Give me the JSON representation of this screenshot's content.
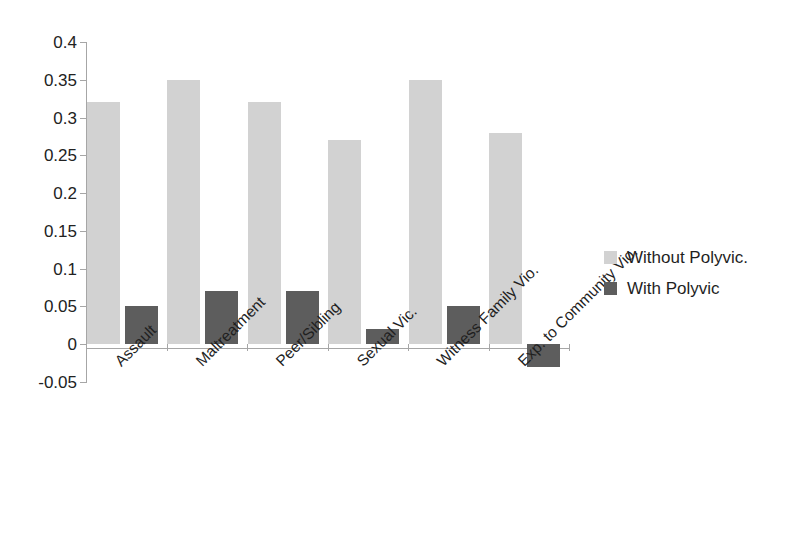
{
  "chart_data": {
    "type": "bar",
    "title": "",
    "subtitle": "",
    "xlabel": "",
    "ylabel": "",
    "categories": [
      "Assault",
      "Maltreatment",
      "Peer/Sibling",
      "Sexual Vic.",
      "Witness Family Vio.",
      "Exp. to Community Vio."
    ],
    "series": [
      {
        "name": "Without Polyvic.",
        "color": "#d2d2d2",
        "values": [
          0.32,
          0.35,
          0.32,
          0.27,
          0.35,
          0.28
        ]
      },
      {
        "name": "With Polyvic",
        "color": "#5d5d5d",
        "values": [
          0.05,
          0.07,
          0.07,
          0.02,
          0.05,
          -0.03
        ]
      }
    ],
    "ylim": [
      -0.05,
      0.4
    ],
    "ytick_values": [
      -0.05,
      0,
      0.05,
      0.1,
      0.15,
      0.2,
      0.25,
      0.3,
      0.35,
      0.4
    ],
    "ytick_labels": [
      "-0.05",
      "0",
      "0.05",
      "0.1",
      "0.15",
      "0.2",
      "0.25",
      "0.3",
      "0.35",
      "0.4"
    ],
    "grid": false,
    "legend_position": "right",
    "legend": [
      {
        "label": "Without Polyvic.",
        "color": "#d2d2d2"
      },
      {
        "label": "With Polyvic",
        "color": "#5d5d5d"
      }
    ]
  },
  "axis": {
    "y_tick_labels": [
      "0.4",
      "0.35",
      "0.3",
      "0.25",
      "0.2",
      "0.15",
      "0.1",
      "0.05",
      "0",
      "-0.05"
    ]
  },
  "legend": {
    "items": [
      {
        "label": "Without Polyvic."
      },
      {
        "label": "With Polyvic"
      }
    ]
  }
}
